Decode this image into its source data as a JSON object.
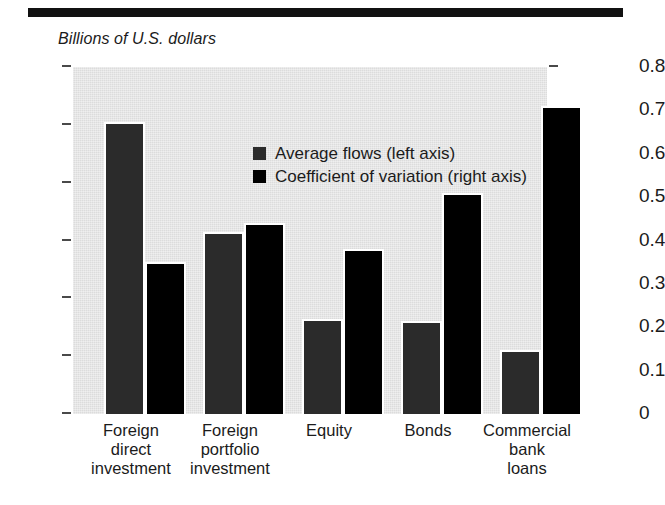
{
  "figure": {
    "units_label": "Billions of U.S. dollars",
    "top_rule": "#111111"
  },
  "legend": {
    "position": "inside-top-center",
    "entries": [
      {
        "label": "Average flows (left axis)",
        "color": "#2b2b2b",
        "key": "flows"
      },
      {
        "label": "Coefficient of variation (right axis)",
        "color": "#000000",
        "key": "cv"
      }
    ]
  },
  "left_axis": {
    "title": "Billions of U.S. dollars",
    "ticks": [
      "0",
      "20",
      "40",
      "60",
      "80",
      "100",
      "120"
    ],
    "min": 0,
    "max": 120
  },
  "right_axis": {
    "ticks": [
      "0",
      "0.1",
      "0.2",
      "0.3",
      "0.4",
      "0.5",
      "0.6",
      "0.7",
      "0.8"
    ],
    "min": 0,
    "max": 0.8
  },
  "categories": [
    "Foreign\ndirect\ninvestment",
    "Foreign\nportfolio\ninvestment",
    "Equity",
    "Bonds",
    "Commercial\nbank\nloans"
  ],
  "chart_data": {
    "type": "bar",
    "title": "",
    "subtitle": "Billions of U.S. dollars",
    "xlabel": "",
    "ylabel": "Billions of U.S. dollars",
    "y2label": "Coefficient of variation",
    "grid": false,
    "legend_position": "inside top center",
    "categories": [
      "Foreign direct investment",
      "Foreign portfolio investment",
      "Equity",
      "Bonds",
      "Commercial bank loans"
    ],
    "series": [
      {
        "name": "Average flows (left axis)",
        "axis": "left",
        "color": "#2b2b2b",
        "values": [
          101,
          63,
          33,
          32,
          22
        ]
      },
      {
        "name": "Coefficient of variation (right axis)",
        "axis": "right",
        "color": "#000000",
        "values": [
          0.35,
          0.44,
          0.38,
          0.51,
          0.71
        ]
      }
    ],
    "ylim": [
      0,
      120
    ],
    "y2lim": [
      0,
      0.8
    ],
    "yticks": [
      0,
      20,
      40,
      60,
      80,
      100,
      120
    ],
    "y2ticks": [
      0,
      0.1,
      0.2,
      0.3,
      0.4,
      0.5,
      0.6,
      0.7,
      0.8
    ]
  }
}
